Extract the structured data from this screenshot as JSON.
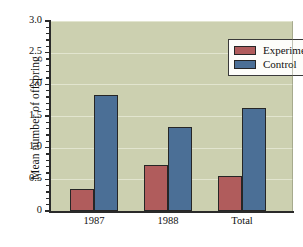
{
  "chart_data": {
    "type": "bar",
    "title": "",
    "xlabel": "",
    "ylabel": "Mean number of offspring",
    "categories": [
      "1987",
      "1988",
      "Total"
    ],
    "series": [
      {
        "name": "Experimental",
        "color": "#b05c5c",
        "values": [
          0.35,
          0.73,
          0.56
        ]
      },
      {
        "name": "Control",
        "color": "#4b6f96",
        "values": [
          1.83,
          1.33,
          1.62
        ]
      }
    ],
    "ylim": [
      0,
      3.0
    ],
    "ytick_labels": [
      "0",
      "0.5",
      "1.0",
      "1.5",
      "2.0",
      "2.5",
      "3.0"
    ],
    "ytick_values": [
      0,
      0.5,
      1.0,
      1.5,
      2.0,
      2.5,
      3.0
    ],
    "yminor_step": 0.1,
    "grid": true,
    "grid_axis": "y",
    "legend_position": "top-right",
    "plot_background": "#ccd0b0",
    "grid_color": "#e2e5cf",
    "figure_background": "#ffffff"
  },
  "legend": {
    "items": [
      {
        "label": "Experimental",
        "color": "#b05c5c"
      },
      {
        "label": "Control",
        "color": "#4b6f96"
      }
    ]
  }
}
